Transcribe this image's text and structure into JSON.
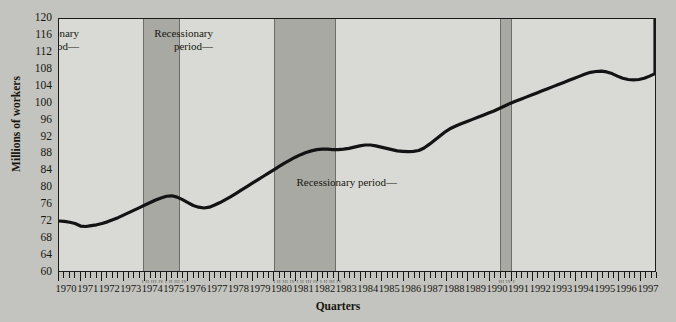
{
  "chart_data": {
    "type": "line",
    "title": "",
    "xlabel": "Quarters",
    "ylabel": "Millions of workers",
    "ylim": [
      60,
      120
    ],
    "ytick_labels": [
      "120",
      "116",
      "112",
      "108",
      "104",
      "100",
      "96",
      "92",
      "88",
      "84",
      "80",
      "76",
      "72",
      "68",
      "64",
      "60"
    ],
    "ytick_values": [
      120,
      116,
      112,
      108,
      104,
      100,
      96,
      92,
      88,
      84,
      80,
      76,
      72,
      68,
      64,
      60
    ],
    "xlim": [
      1970,
      1997.75
    ],
    "grid": false,
    "legend": "none",
    "xtick_labels": [
      "1970",
      "1971",
      "1972",
      "1973",
      "1974",
      "1975",
      "1976",
      "1977",
      "1978",
      "1979",
      "1980",
      "1981",
      "1982",
      "1983",
      "1984",
      "1985",
      "1986",
      "1987",
      "1988",
      "1989",
      "1990",
      "1991",
      "1992",
      "1993",
      "1994",
      "1995",
      "1996",
      "1997"
    ],
    "xtick_values": [
      1970,
      1971,
      1972,
      1973,
      1974,
      1975,
      1976,
      1977,
      1978,
      1979,
      1980,
      1981,
      1982,
      1983,
      1984,
      1985,
      1986,
      1987,
      1988,
      1989,
      1990,
      1991,
      1992,
      1993,
      1994,
      1995,
      1996,
      1997
    ],
    "quarter_marks_per_year": 4,
    "series": [
      {
        "name": "Civilian employment",
        "x": [
          1970.0,
          1970.25,
          1970.5,
          1970.75,
          1971.0,
          1971.25,
          1971.5,
          1971.75,
          1972.0,
          1972.25,
          1972.5,
          1972.75,
          1973.0,
          1973.25,
          1973.5,
          1973.75,
          1974.0,
          1974.25,
          1974.5,
          1974.75,
          1975.0,
          1975.25,
          1975.5,
          1975.75,
          1976.0,
          1976.25,
          1976.5,
          1976.75,
          1977.0,
          1977.25,
          1977.5,
          1977.75,
          1978.0,
          1978.25,
          1978.5,
          1978.75,
          1979.0,
          1979.25,
          1979.5,
          1979.75,
          1980.0,
          1980.25,
          1980.5,
          1980.75,
          1981.0,
          1981.25,
          1981.5,
          1981.75,
          1982.0,
          1982.25,
          1982.5,
          1982.75,
          1983.0,
          1983.25,
          1983.5,
          1983.75,
          1984.0,
          1984.25,
          1984.5,
          1984.75,
          1985.0,
          1985.25,
          1985.5,
          1985.75,
          1986.0,
          1986.25,
          1986.5,
          1986.75,
          1987.0,
          1987.25,
          1987.5,
          1987.75,
          1988.0,
          1988.25,
          1988.5,
          1988.75,
          1989.0,
          1989.25,
          1989.5,
          1989.75,
          1990.0,
          1990.25,
          1990.5,
          1990.75,
          1991.0,
          1991.25,
          1991.5,
          1991.75,
          1992.0,
          1992.25,
          1992.5,
          1992.75,
          1993.0,
          1993.25,
          1993.5,
          1993.75,
          1994.0,
          1994.25,
          1994.5,
          1994.75,
          1995.0,
          1995.25,
          1995.5,
          1995.75,
          1996.0,
          1996.25,
          1996.5,
          1996.75,
          1997.0,
          1997.25,
          1997.5,
          1997.75
        ],
        "y": [
          71.9,
          71.8,
          71.6,
          71.3,
          70.7,
          70.6,
          70.8,
          71.0,
          71.3,
          71.7,
          72.2,
          72.7,
          73.3,
          73.9,
          74.5,
          75.1,
          75.7,
          76.3,
          76.9,
          77.4,
          77.8,
          77.9,
          77.6,
          77.0,
          76.3,
          75.6,
          75.2,
          75.0,
          75.2,
          75.7,
          76.3,
          77.0,
          77.7,
          78.5,
          79.3,
          80.1,
          80.9,
          81.7,
          82.5,
          83.3,
          84.1,
          84.9,
          85.7,
          86.4,
          87.1,
          87.7,
          88.2,
          88.6,
          88.9,
          89.0,
          89.0,
          88.9,
          88.9,
          89.0,
          89.2,
          89.5,
          89.8,
          90.0,
          90.0,
          89.8,
          89.5,
          89.2,
          88.9,
          88.6,
          88.5,
          88.4,
          88.5,
          88.7,
          89.3,
          90.2,
          91.2,
          92.2,
          93.2,
          94.0,
          94.6,
          95.1,
          95.6,
          96.1,
          96.6,
          97.1,
          97.6,
          98.1,
          98.7,
          99.3,
          99.9,
          100.4,
          100.9,
          101.4,
          101.9,
          102.4,
          102.9,
          103.4,
          103.9,
          104.4,
          104.9,
          105.4,
          105.9,
          106.4,
          106.9,
          107.3,
          107.5,
          107.6,
          107.4,
          107.0,
          106.4,
          105.9,
          105.6,
          105.5,
          105.6,
          105.9,
          106.4,
          107.0
        ],
        "y_tail": [
          107.0,
          107.6,
          108.3,
          109.0,
          109.7,
          110.4,
          111.1,
          111.8,
          112.4,
          112.9,
          113.4,
          114.0,
          114.7,
          115.4,
          116.1,
          116.8,
          117.5,
          118.2,
          118.9,
          119.6,
          120.0
        ]
      }
    ],
    "shaded_regions": [
      {
        "label": "Recessionary period",
        "start": 1973.9,
        "end": 1975.6,
        "color": "#a9a9a4"
      },
      {
        "label": "Recessionary period",
        "start": 1980.0,
        "end": 1982.85,
        "color": "#a9a9a4"
      },
      {
        "label": "Recessionary period",
        "start": 1990.45,
        "end": 1991.0,
        "color": "#a9a9a4"
      }
    ],
    "annotations": [
      {
        "text": "Recessionary\nperiod—",
        "x_px": 78,
        "y_px": 26,
        "align": "right"
      },
      {
        "text": "Recessionary\nperiod—",
        "x_px": 212,
        "y_px": 26,
        "align": "right"
      },
      {
        "text": "Recessionary period—",
        "x_px": 396,
        "y_px": 175,
        "align": "right"
      }
    ],
    "band_quarter_labels": [
      {
        "text": "I  II  III  IV  I  II  III  IV",
        "start": 1973.9,
        "end": 1975.6
      },
      {
        "text": "I II III IV I II III IV I II III IV",
        "start": 1980.0,
        "end": 1982.85
      },
      {
        "text": "III IV I",
        "start": 1990.45,
        "end": 1991.0
      }
    ],
    "colors": {
      "figure_background": "#c3c3bf",
      "plot_background": "#d9d9d5",
      "band": "#a9a9a4",
      "line": "#131313",
      "axis": "#1a1a1a",
      "text": "#17170f"
    }
  }
}
